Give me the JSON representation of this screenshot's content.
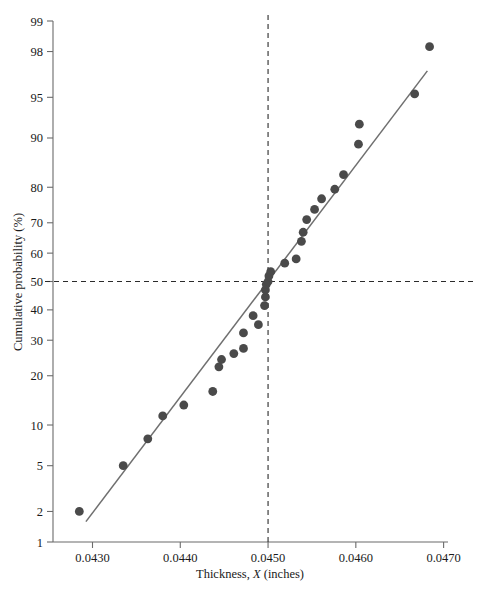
{
  "figure": {
    "title": "",
    "caption": "",
    "background_color": "#ffffff",
    "point_color": "#4a4a4a",
    "line_color": "#6f6f6f",
    "axis_color": "#6b6b6b",
    "reference_line_color": "#2b2b2b"
  },
  "axes": {
    "x_title_prefix": "Thickness, ",
    "x_title_symbol": "X",
    "x_title_suffix": " (inches)",
    "y_title": "Cumulative probability (%)"
  },
  "chart_data": {
    "type": "scatter",
    "title": "",
    "xlabel": "Thickness, X (inches)",
    "ylabel": "Cumulative probability (%)",
    "xlim": [
      0.04255,
      0.04705
    ],
    "ylim": [
      1,
      99
    ],
    "y_scale": "normal-probability",
    "grid": false,
    "legend": null,
    "xticks": [
      0.043,
      0.044,
      0.045,
      0.046,
      0.047
    ],
    "xtick_labels": [
      "0.0430",
      "0.0440",
      "0.0450",
      "0.0460",
      "0.0470"
    ],
    "yticks": [
      1,
      2,
      5,
      10,
      20,
      30,
      40,
      50,
      60,
      70,
      80,
      90,
      95,
      98,
      99
    ],
    "ytick_labels": [
      "1",
      "2",
      "5",
      "10",
      "20",
      "30",
      "40",
      "50",
      "60",
      "70",
      "80",
      "90",
      "95",
      "98",
      "99"
    ],
    "x": [
      0.04285,
      0.04335,
      0.04363,
      0.0438,
      0.04404,
      0.04437,
      0.04444,
      0.04447,
      0.04461,
      0.04472,
      0.04472,
      0.04483,
      0.04489,
      0.04496,
      0.04497,
      0.04497,
      0.04498,
      0.045,
      0.04501,
      0.04503,
      0.04519,
      0.04532,
      0.04538,
      0.0454,
      0.04544,
      0.04553,
      0.04561,
      0.04576,
      0.04586,
      0.04603,
      0.04604,
      0.04667,
      0.04684
    ],
    "y": [
      2.0,
      5.0,
      8.0,
      11.5,
      13.5,
      16.3,
      22.3,
      24.3,
      26.0,
      32.3,
      27.5,
      38.0,
      35.0,
      41.5,
      44.5,
      47.0,
      49.0,
      50.0,
      52.0,
      53.5,
      56.5,
      58.0,
      64.0,
      67.0,
      71.0,
      74.0,
      77.0,
      79.5,
      83.0,
      89.0,
      92.0,
      95.3,
      98.2
    ],
    "n_points": 33,
    "fit_line": {
      "description": "straight reference fit line",
      "x_start": 0.042925,
      "y_start": 1.6,
      "x_end": 0.046815,
      "y_end": 97.0
    },
    "reference_lines": [
      {
        "orientation": "vertical",
        "value": 0.045,
        "style": "dashed"
      },
      {
        "orientation": "horizontal",
        "value": 50,
        "style": "dashed"
      }
    ]
  }
}
